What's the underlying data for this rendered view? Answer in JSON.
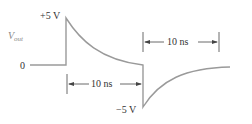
{
  "diagram": {
    "signal_label": "V",
    "signal_subscript": "out",
    "zero_label": "0",
    "pos_peak_label": "+5 V",
    "neg_peak_label": "−5 V",
    "interval_top_label": "10 ns",
    "interval_bottom_label": "10 ns",
    "colors": {
      "waveform": "#9a9a9a",
      "text": "#333333",
      "arrow": "#444444"
    }
  }
}
